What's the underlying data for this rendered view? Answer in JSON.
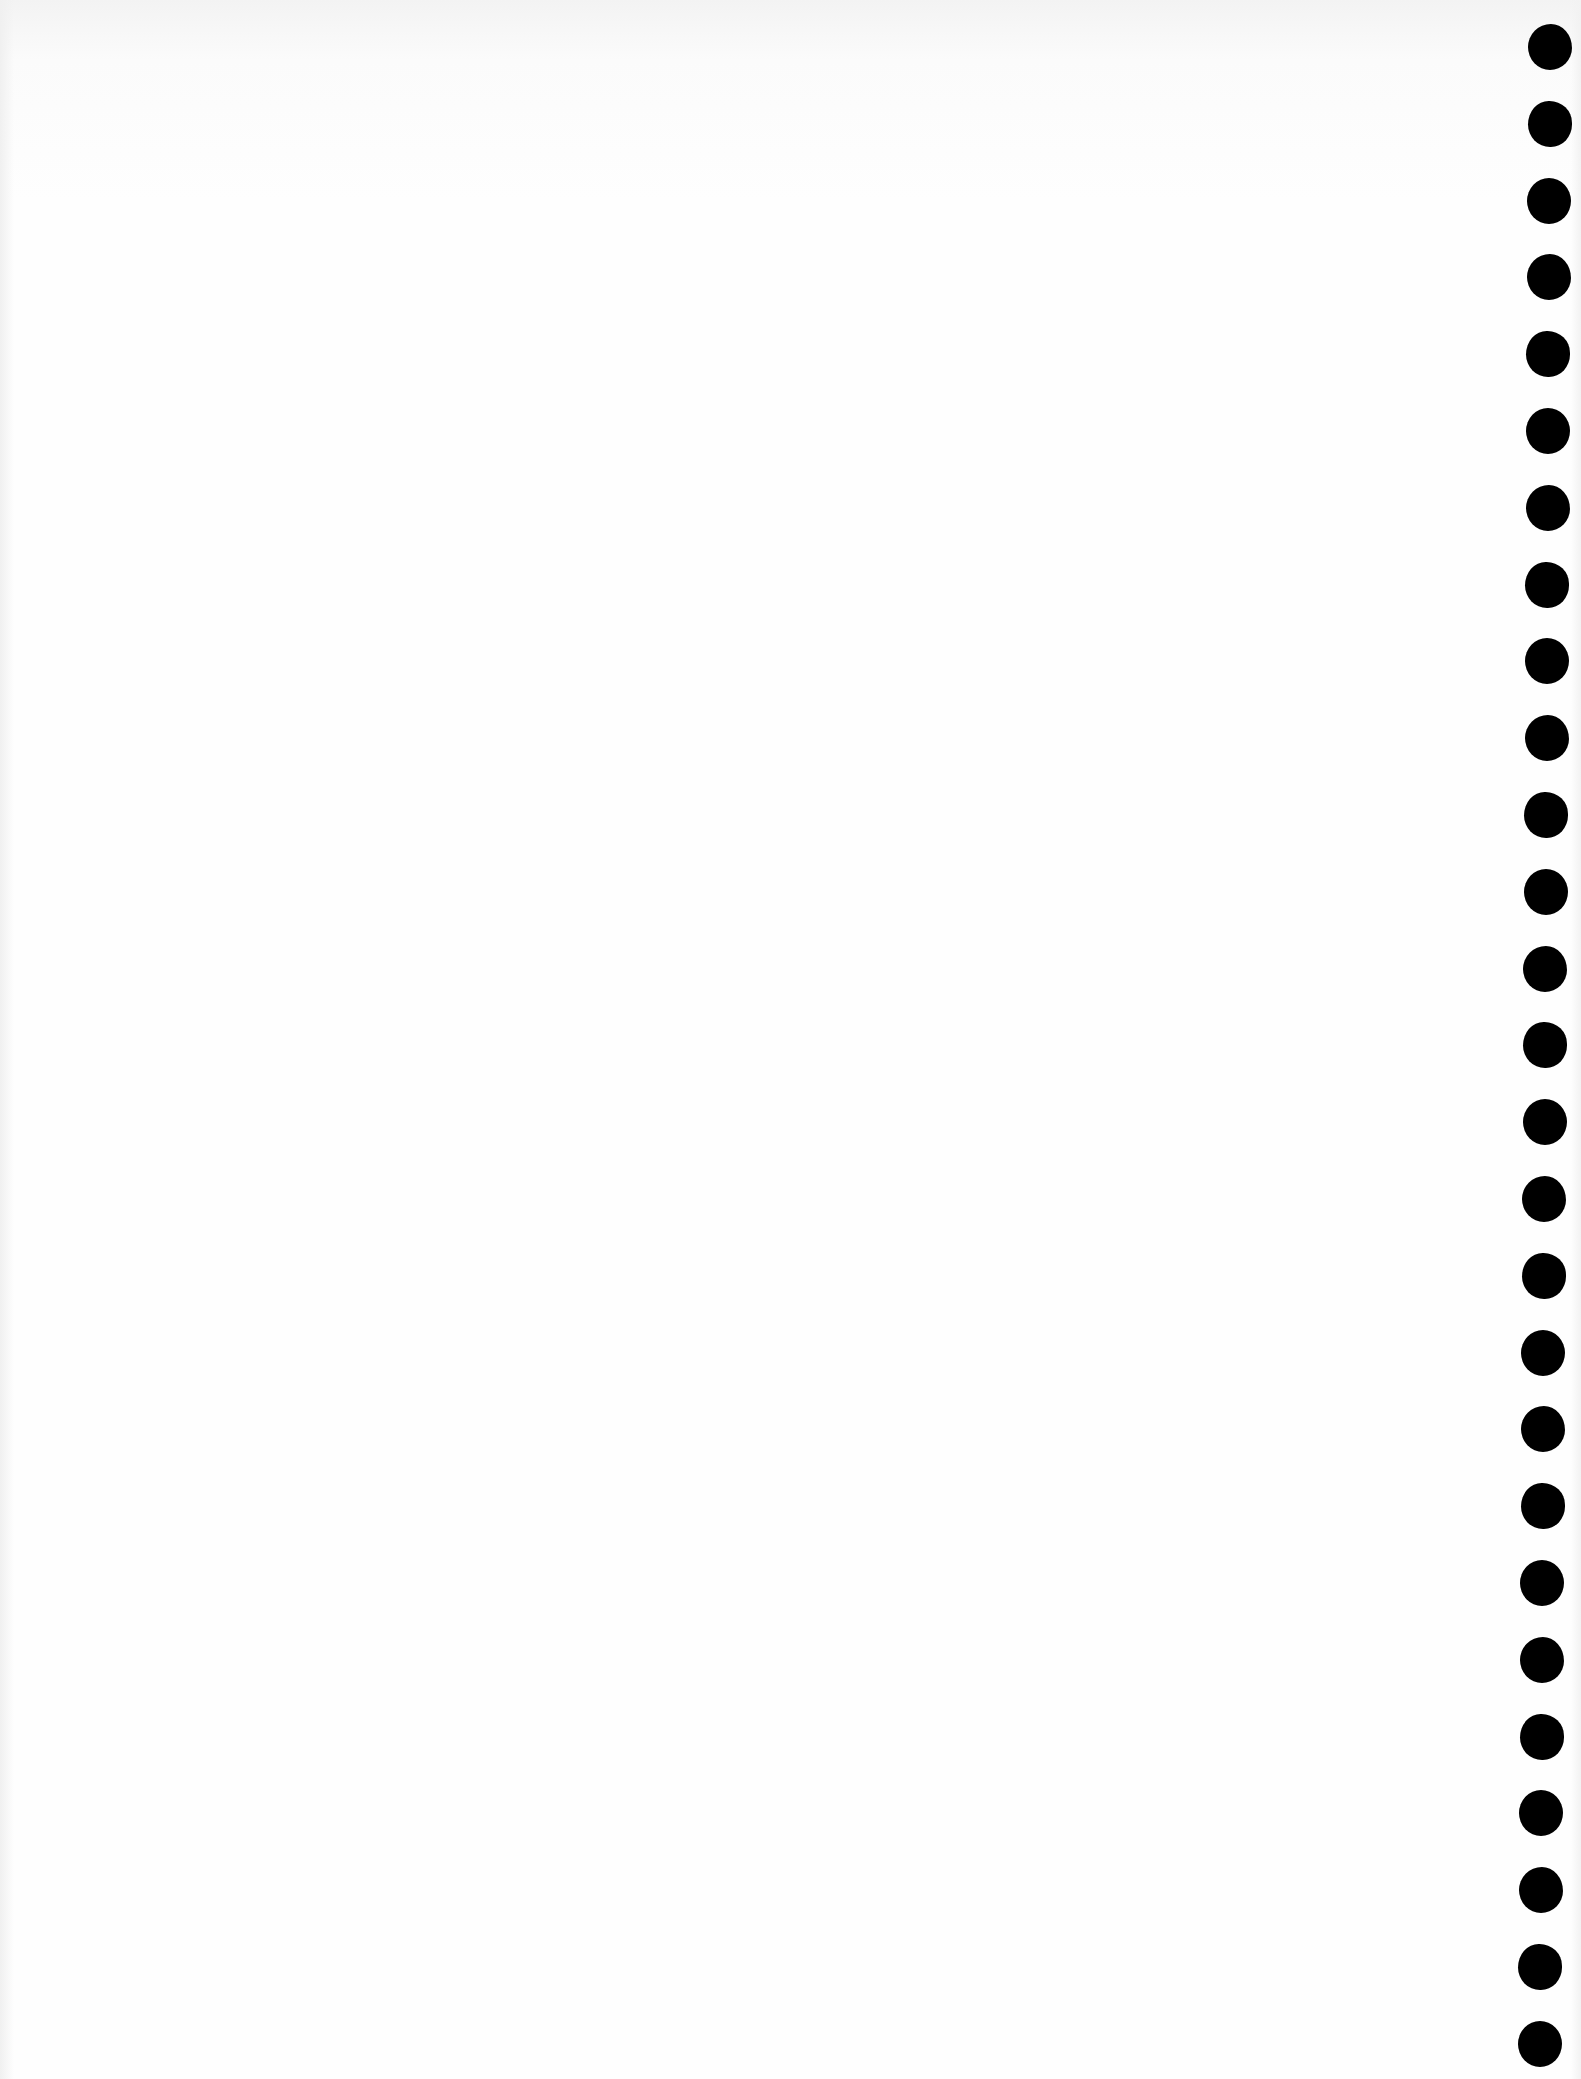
{
  "page": {
    "kind": "blank scanned sheet with binder punch holes",
    "background_color": "#fefefe",
    "text_content": ""
  },
  "punch_holes": {
    "count": 27,
    "color": "#000000",
    "diameter_px": 44,
    "first_center_y": 47,
    "spacing_px": 76.8,
    "center_x_top": 1550,
    "center_x_bottom": 1540
  }
}
